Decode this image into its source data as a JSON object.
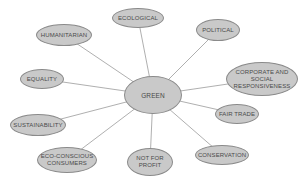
{
  "diagram": {
    "type": "mind-map",
    "center": {
      "id": "green",
      "label": "GREEN",
      "x": 153,
      "y": 95,
      "w": 58,
      "h": 38
    },
    "nodes": [
      {
        "id": "ecological",
        "label": "ECOLOGICAL",
        "x": 138,
        "y": 18,
        "w": 52,
        "h": 20
      },
      {
        "id": "humanitarian",
        "label": "HUMANITARIAN",
        "x": 64,
        "y": 35,
        "w": 56,
        "h": 22
      },
      {
        "id": "political",
        "label": "POLITICAL",
        "x": 218,
        "y": 30,
        "w": 44,
        "h": 22
      },
      {
        "id": "equality",
        "label": "EQUALITY",
        "x": 42,
        "y": 79,
        "w": 44,
        "h": 20
      },
      {
        "id": "corporate",
        "label": "CORPORATE AND\nSOCIAL\nRESPONSIVENESS",
        "x": 262,
        "y": 79,
        "w": 72,
        "h": 34
      },
      {
        "id": "sustainability",
        "label": "SUSTAINABILITY",
        "x": 38,
        "y": 125,
        "w": 56,
        "h": 22
      },
      {
        "id": "fair-trade",
        "label": "FAIR TRADE",
        "x": 237,
        "y": 114,
        "w": 44,
        "h": 20
      },
      {
        "id": "eco-conscious",
        "label": "ECO-CONSCIOUS\nCONSUMERS",
        "x": 67,
        "y": 160,
        "w": 60,
        "h": 26
      },
      {
        "id": "not-for-profit",
        "label": "NOT FOR\nPROFIT",
        "x": 150,
        "y": 162,
        "w": 46,
        "h": 28
      },
      {
        "id": "conservation",
        "label": "CONSERVATION",
        "x": 222,
        "y": 155,
        "w": 54,
        "h": 20
      }
    ],
    "colors": {
      "node_fill": "#c9c9c9",
      "node_border": "#8a8a8a",
      "line": "#9a9a9a",
      "text": "#4a4a4a"
    }
  }
}
